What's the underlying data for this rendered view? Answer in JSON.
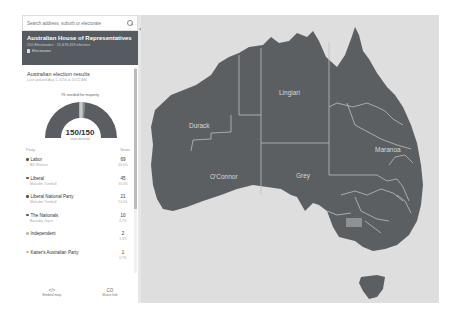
{
  "search": {
    "placeholder": "Search address, suburb or electorate"
  },
  "header": {
    "title": "Australian House of Representatives",
    "subtitle": "150 Electorates · 15,676,659 electors",
    "link_label": "Electorates"
  },
  "results": {
    "title": "Australian election results",
    "updated": "Last updated Aug 1, 2016 at 10:22 AM",
    "gauge_label": "76 needed for majority",
    "seats_counted": "150/150",
    "seats_counted_sub": "seats declared"
  },
  "table": {
    "col_party": "Party",
    "col_seats": "Seats",
    "parties": [
      {
        "name": "Labor",
        "leader": "Bill Shorten",
        "seats": "69",
        "pct": "46.0%"
      },
      {
        "name": "Liberal",
        "leader": "Malcolm Turnbull",
        "seats": "45",
        "pct": "30.0%"
      },
      {
        "name": "Liberal National Party",
        "leader": "Malcolm Turnbull",
        "seats": "21",
        "pct": "14.0%"
      },
      {
        "name": "The Nationals",
        "leader": "Barnaby Joyce",
        "seats": "10",
        "pct": "6.7%"
      },
      {
        "name": "Independent",
        "leader": "",
        "seats": "2",
        "pct": "1.3%"
      },
      {
        "name": "Katter's Australian Party",
        "leader": "",
        "seats": "1",
        "pct": "0.7%"
      }
    ]
  },
  "footer": {
    "embed_icon": "</>",
    "embed_label": "Embed map",
    "share_icon": "CO",
    "share_label": "Share link",
    "note": "Data notes: This is a map of the electorates for the Australian House of Representatives."
  },
  "map": {
    "labels": {
      "durack": "Durack",
      "lingiari": "Lingiari",
      "maranoa": "Maranoa",
      "oconnor": "O'Connor",
      "grey": "Grey"
    },
    "colors": {
      "land": "#5c5f62",
      "sea": "#dedede",
      "border": "#bdbdbd"
    }
  },
  "colors": {
    "header_bg": "#555b60",
    "gauge_main": "#5a5e62",
    "gauge_minor": "#9a9a9a"
  }
}
